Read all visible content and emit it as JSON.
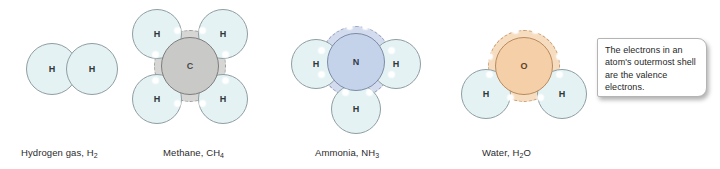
{
  "figure": {
    "type": "diagram",
    "background_color": "#ffffff",
    "width": 720,
    "height": 169
  },
  "callout": {
    "text": "The electrons in an atom's outermost shell are the valence electrons.",
    "background_color": "#ffffff",
    "border_color": "#b4b4b4"
  },
  "colors": {
    "hydrogen_fill": "#e4f2f4",
    "hydrogen_stroke": "#8f9ea3",
    "carbon_fill": "#c9c9c7",
    "carbon_shell": "#d6d6d4",
    "nitrogen_fill": "#c4d2ea",
    "nitrogen_shell": "#d3dcef",
    "oxygen_fill": "#f5cfa8",
    "oxygen_shell": "#f7ddc0",
    "electron_dot": "#ffffff",
    "label_text": "#2b2b2b"
  },
  "molecules": [
    {
      "id": "hydrogen-gas",
      "caption_name": "Hydrogen gas,",
      "formula_base": "H",
      "formula_sub": "2",
      "caption_full": "Hydrogen gas, H2",
      "atom_symbols": [
        "H",
        "H"
      ],
      "central_atom": null,
      "hydrogen_count": 2,
      "valence_electrons_shown": 0
    },
    {
      "id": "methane",
      "caption_name": "Methane,",
      "formula_base": "CH",
      "formula_sub": "4",
      "caption_full": "Methane, CH4",
      "atom_symbols": [
        "C",
        "H",
        "H",
        "H",
        "H"
      ],
      "central_atom": "C",
      "hydrogen_count": 4,
      "valence_electrons_shown": 8
    },
    {
      "id": "ammonia",
      "caption_name": "Ammonia,",
      "formula_base": "NH",
      "formula_sub": "3",
      "caption_full": "Ammonia, NH3",
      "atom_symbols": [
        "N",
        "H",
        "H",
        "H"
      ],
      "central_atom": "N",
      "hydrogen_count": 3,
      "valence_electrons_shown": 8
    },
    {
      "id": "water",
      "caption_name": "Water,",
      "formula_base": "H",
      "formula_sub": "2",
      "formula_tail": "O",
      "caption_full": "Water, H2O",
      "atom_symbols": [
        "O",
        "H",
        "H"
      ],
      "central_atom": "O",
      "hydrogen_count": 2,
      "valence_electrons_shown": 8
    }
  ]
}
